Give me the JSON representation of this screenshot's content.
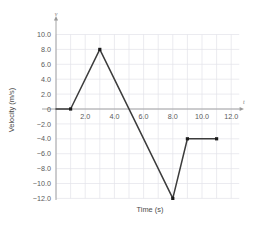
{
  "chart_data": {
    "type": "line",
    "title": "",
    "xlabel": "Time (s)",
    "ylabel": "Velocity (m/s)",
    "x_axis_letter": "t",
    "y_axis_letter": "v",
    "xlim": [
      0,
      12.6
    ],
    "ylim": [
      -13.0,
      11.0
    ],
    "grid": true,
    "legend": null,
    "x_ticks": [
      2.0,
      4.0,
      6.0,
      8.0,
      10.0,
      12.0
    ],
    "x_tick_labels": [
      "2.0",
      "4.0",
      "6.0",
      "8.0",
      "10.0",
      "12.0"
    ],
    "y_ticks": [
      10.0,
      8.0,
      6.0,
      4.0,
      2.0,
      0,
      -2.0,
      -4.0,
      -6.0,
      -8.0,
      -10.0,
      -12.0
    ],
    "y_tick_labels": [
      "10.0",
      "8.0",
      "6.0",
      "4.0",
      "2.0",
      "0",
      "−2.0",
      "−4.0",
      "−6.0",
      "−8.0",
      "−10.0",
      "−12.0"
    ],
    "grid_x_step": 1.0,
    "grid_y_step": 2.0,
    "line_color": "#3c3c3c",
    "marker_color": "#1a1a1a",
    "grid_color": "#e2e2ea",
    "axis_color": "#9a9a9a",
    "x": [
      0.0,
      1.0,
      3.0,
      8.0,
      9.0,
      11.0
    ],
    "values": [
      0.0,
      0.0,
      8.0,
      -12.0,
      -4.0,
      -4.0
    ],
    "points": [
      {
        "x": 0.0,
        "y": 0.0,
        "marker": false
      },
      {
        "x": 1.0,
        "y": 0.0,
        "marker": true
      },
      {
        "x": 3.0,
        "y": 8.0,
        "marker": true
      },
      {
        "x": 8.0,
        "y": -12.0,
        "marker": true
      },
      {
        "x": 9.0,
        "y": -4.0,
        "marker": true
      },
      {
        "x": 11.0,
        "y": -4.0,
        "marker": true
      }
    ]
  }
}
